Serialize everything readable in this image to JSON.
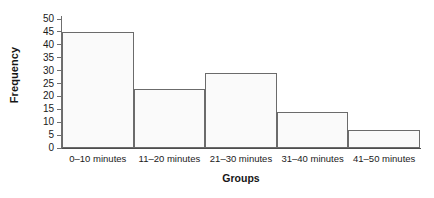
{
  "chart_data": {
    "type": "bar",
    "title": "",
    "subtitle": "",
    "xlabel": "Groups",
    "ylabel": "Frequency",
    "categories": [
      "0–10 minutes",
      "11–20 minutes",
      "21–30 minutes",
      "31–40 minutes",
      "41–50 minutes"
    ],
    "values": [
      45,
      23,
      29,
      14,
      7
    ],
    "ylim": [
      0,
      50
    ],
    "ytick_values": [
      0,
      5,
      10,
      15,
      20,
      25,
      30,
      35,
      40,
      45,
      50
    ],
    "ytick_labels": [
      "0",
      "5",
      "10",
      "15",
      "20",
      "25",
      "30",
      "35",
      "40",
      "45",
      "50"
    ],
    "grid": false,
    "legend": null,
    "legend_position": "none",
    "bar_style": "contiguous-histogram",
    "colors": {
      "bar_fill": "#fafafa",
      "bar_border": "#6b6b6b",
      "axis": "#4d4d4d",
      "text": "#1a1a1a",
      "background": "#ffffff"
    }
  }
}
